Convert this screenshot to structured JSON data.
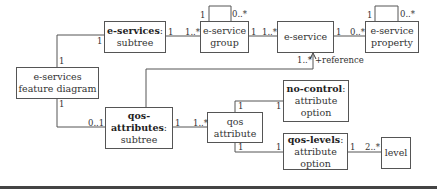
{
  "diagram": {
    "type": "uml-class-diagram",
    "boxes": {
      "feature_diagram": {
        "line1": "e-services",
        "line2": "feature diagram"
      },
      "eservices_subtree": {
        "bold": "e-services",
        "suffix": ":",
        "line2": "subtree"
      },
      "eservice_group": {
        "line1": "e-service",
        "line2": "group"
      },
      "eservice": {
        "line1": "e-service"
      },
      "eservice_property": {
        "line1": "e-service",
        "line2": "property"
      },
      "qos_subtree": {
        "bold": "qos-attributes",
        "suffix": ":",
        "line2": "subtree"
      },
      "qos_attribute": {
        "line1": "qos",
        "line2": "attribute"
      },
      "no_control": {
        "bold": "no-control",
        "suffix": ":",
        "line2": "attribute",
        "line3": "option"
      },
      "qos_levels": {
        "bold": "qos-levels",
        "suffix": ":",
        "line2": "attribute",
        "line3": "option"
      },
      "level": {
        "line1": "level"
      }
    },
    "multiplicities": {
      "fd_top": "1",
      "est_left": "1",
      "est_right": "1",
      "group_left": "1..*",
      "group_self_1": "1",
      "group_self_many": "0..*",
      "group_right": "1",
      "eservice_left": "1..*",
      "eservice_right": "1",
      "property_left": "0..*",
      "property_self_1": "1",
      "property_self_many": "0..*",
      "reference_mult": "1..*",
      "reference_role": "+reference",
      "fd_bottom": "1",
      "qos_left": "0..1",
      "qos_right": "1",
      "attr_left": "1..*",
      "attr_top": "1",
      "nocontrol_left": "1",
      "attr_bottom": "1",
      "levels_left": "1",
      "levels_right": "1",
      "level_left": "2..*"
    }
  }
}
